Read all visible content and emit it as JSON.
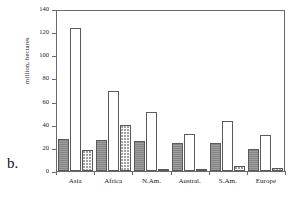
{
  "figure": {
    "letter": "b."
  },
  "chart_data": {
    "type": "bar",
    "title": "",
    "xlabel": "",
    "ylabel": "million, hectares",
    "ylim": [
      0,
      140
    ],
    "ytick_values": [
      0,
      20,
      40,
      60,
      80,
      100,
      120,
      140
    ],
    "ytick_labels": [
      "0",
      "20",
      "40",
      "60",
      "80",
      "100",
      "120",
      "140"
    ],
    "grid": false,
    "legend": "none",
    "categories": [
      "Asia",
      "Africa",
      "N.Am.",
      "Austral.",
      "S.Am.",
      "Europe"
    ],
    "series": [
      {
        "name": "series-1-solid",
        "fill": "solid-gray",
        "color": "#8e8e8e",
        "values": [
          28,
          27,
          26,
          24,
          24,
          19
        ]
      },
      {
        "name": "series-2-open",
        "fill": "white-outline",
        "color": "#ffffff",
        "values": [
          124,
          69,
          51,
          32,
          43,
          31
        ]
      },
      {
        "name": "series-3-stipple",
        "fill": "stippled",
        "color": "#fbfbfb",
        "values": [
          18,
          40,
          2,
          1,
          4,
          3
        ]
      }
    ]
  }
}
